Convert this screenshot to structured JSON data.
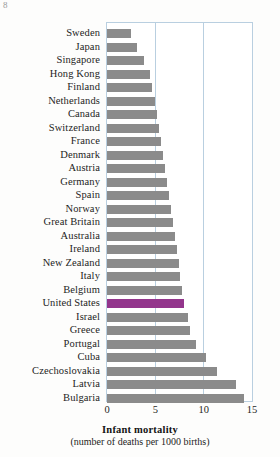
{
  "chart_data": {
    "type": "bar",
    "orientation": "horizontal",
    "title": "Infant mortality",
    "subtitle": "(number of deaths per 1000 births)",
    "xlabel": "Infant mortality",
    "ylabel": "",
    "xlim": [
      0,
      15
    ],
    "ticks": [
      0,
      5,
      10,
      15
    ],
    "tick_labels": [
      "0",
      "5",
      "10",
      "15"
    ],
    "grid": true,
    "legend": "none",
    "bar_color": "#8b8b8b",
    "highlight_color": "#93358c",
    "highlight_category": "United States",
    "categories": [
      "Sweden",
      "Japan",
      "Singapore",
      "Hong Kong",
      "Finland",
      "Netherlands",
      "Canada",
      "Switzerland",
      "France",
      "Denmark",
      "Austria",
      "Germany",
      "Spain",
      "Norway",
      "Great Britain",
      "Australia",
      "Ireland",
      "New Zealand",
      "Italy",
      "Belgium",
      "United States",
      "Israel",
      "Greece",
      "Portugal",
      "Cuba",
      "Czechoslovakia",
      "Latvia",
      "Bulgaria"
    ],
    "values": [
      2.5,
      3.1,
      3.8,
      4.4,
      4.7,
      5.0,
      5.2,
      5.4,
      5.6,
      5.8,
      6.0,
      6.2,
      6.4,
      6.6,
      6.8,
      7.0,
      7.2,
      7.4,
      7.6,
      7.8,
      8.0,
      8.4,
      8.6,
      9.2,
      10.2,
      11.4,
      13.3,
      14.2
    ]
  },
  "corner_mark": "8"
}
